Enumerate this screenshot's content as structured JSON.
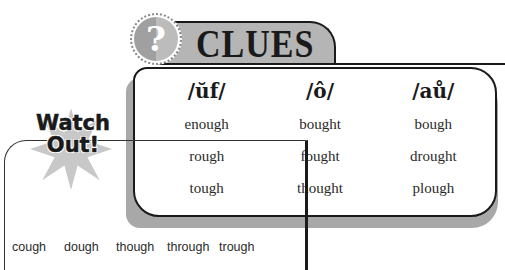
{
  "clues": {
    "title": "CLUES",
    "icon": "question-mark-icon",
    "icon_glyph": "?",
    "columns": [
      {
        "heading": "/ŭf/",
        "words": [
          "enough",
          "rough",
          "tough"
        ]
      },
      {
        "heading": "/ô/",
        "words": [
          "bought",
          "fought",
          "thought"
        ]
      },
      {
        "heading": "/aů/",
        "words": [
          "bough",
          "drought",
          "plough"
        ]
      }
    ]
  },
  "watch_out": {
    "title_line1": "Watch",
    "title_line2": "Out!",
    "words": [
      "cough",
      "dough",
      "though",
      "through",
      "trough"
    ]
  },
  "colors": {
    "banner_gray": "#b5b5b5",
    "shadow_gray": "#a8a8a8",
    "star_gray": "#c8c8c8",
    "ink": "#1a1a1a"
  }
}
